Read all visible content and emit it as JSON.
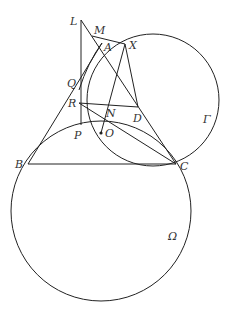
{
  "diagram": {
    "type": "geometry",
    "points": {
      "L": {
        "label": "L",
        "x": 81,
        "y": 20
      },
      "M": {
        "label": "M",
        "x": 92,
        "y": 36
      },
      "A": {
        "label": "A",
        "x": 102,
        "y": 43
      },
      "X": {
        "label": "X",
        "x": 125,
        "y": 44
      },
      "Q": {
        "label": "Q",
        "x": 81,
        "y": 84
      },
      "R": {
        "label": "R",
        "x": 79,
        "y": 103
      },
      "N": {
        "label": "N",
        "x": 110,
        "y": 106
      },
      "D": {
        "label": "D",
        "x": 138,
        "y": 107
      },
      "P": {
        "label": "P",
        "x": 83,
        "y": 125
      },
      "O": {
        "label": "O",
        "x": 101,
        "y": 133
      },
      "B": {
        "label": "B",
        "x": 28,
        "y": 164
      },
      "C": {
        "label": "C",
        "x": 176,
        "y": 164
      }
    },
    "circles": {
      "gamma": {
        "label": "Γ",
        "cx": 153,
        "cy": 100,
        "r": 66
      },
      "omega": {
        "label": "Ω",
        "cx": 101,
        "cy": 211,
        "r": 90
      }
    }
  }
}
